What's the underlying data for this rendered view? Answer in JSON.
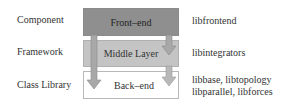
{
  "layers": [
    {
      "category": "Component",
      "layer": "Front–end",
      "libraries": [
        "libfrontend"
      ]
    },
    {
      "category": "Framework",
      "layer": "Middle Layer",
      "libraries": [
        "libintegrators"
      ]
    },
    {
      "category": "Class Library",
      "layer": "Back–end",
      "libraries": [
        "libbase, libtopology",
        "libparallel, libforces"
      ]
    }
  ],
  "colors": {
    "front_end": "#8f8f8f",
    "middle_layer": "#c4c4c4",
    "back_end": "#ffffff",
    "arrow": "#a8a8a8"
  },
  "arrows": [
    {
      "from": "Front–end",
      "to": "Back–end"
    },
    {
      "from": "Front–end",
      "to": "Middle Layer"
    },
    {
      "from": "Middle Layer",
      "to": "Back–end"
    }
  ]
}
